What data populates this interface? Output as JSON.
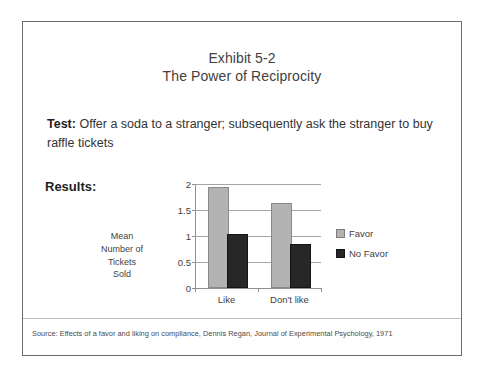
{
  "slide": {
    "title_lines": [
      "Exhibit 5-2",
      "The Power of Reciprocity"
    ],
    "test": {
      "label": "Test:",
      "text": " Offer a soda to a stranger; subsequently ask the stranger to buy raffle tickets"
    },
    "results_label": "Results:",
    "source": "Source: Effects of a favor and liking on compliance, Dennis Regan, Journal of Experimental Psychology, 1971"
  },
  "chart_data": {
    "type": "bar",
    "title": "",
    "categories": [
      "Like",
      "Don't like"
    ],
    "series": [
      {
        "name": "Favor",
        "values": [
          1.9,
          1.6
        ],
        "color": "#b3b3b3"
      },
      {
        "name": "No Favor",
        "values": [
          1.0,
          0.8
        ],
        "color": "#272727"
      }
    ],
    "xlabel": "",
    "ylabel": "Mean Number of Tickets Sold",
    "ylabel_lines": [
      "Mean",
      "Number of",
      "Tickets",
      "Sold"
    ],
    "ylim": [
      0,
      2
    ],
    "yticks": [
      "0",
      "0.5",
      "1",
      "1.5",
      "2"
    ],
    "ytick_values": [
      0,
      0.5,
      1,
      1.5,
      2
    ],
    "grid": true,
    "legend_position": "right"
  }
}
